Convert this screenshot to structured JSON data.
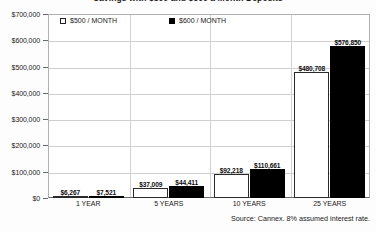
{
  "chart_data": {
    "type": "bar",
    "title": "Savings with $500 and $600 a Month Deposits",
    "xlabel": "",
    "ylabel": "",
    "ylim": [
      0,
      700000
    ],
    "grid": true,
    "legend_position": "top-left-inside",
    "categories": [
      "1 YEAR",
      "5 YEARS",
      "10 YEARS",
      "25 YEARS"
    ],
    "series": [
      {
        "name": "$500 / MONTH",
        "marker": "open-square",
        "color": "#ffffff",
        "values": [
          6267,
          37009,
          92218,
          480708
        ],
        "labels": [
          "$6,267",
          "$37,009",
          "$92,218",
          "$480,708"
        ]
      },
      {
        "name": "$600 / MONTH",
        "marker": "filled-square",
        "color": "#000000",
        "values": [
          7521,
          44411,
          110661,
          576850
        ],
        "labels": [
          "$7,521",
          "$44,411",
          "$110,661",
          "$576,850"
        ]
      }
    ],
    "y_ticks": [
      0,
      100000,
      200000,
      300000,
      400000,
      500000,
      600000,
      700000
    ],
    "y_tick_labels": [
      "$0",
      "$100,000",
      "$200,000",
      "$300,000",
      "$400,000",
      "$500,000",
      "$600,000",
      "$700,000"
    ],
    "annotations": {
      "source": "Source: Cannex. 8% assumed interest rate."
    }
  }
}
